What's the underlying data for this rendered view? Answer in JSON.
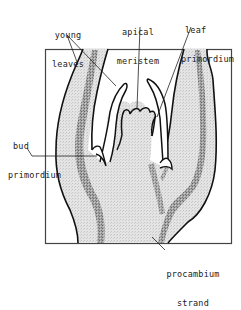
{
  "diagram": {
    "colors": {
      "outline": "#111111",
      "tissue_fill": "#dcdcdc",
      "procambium_fill": "#8a8a8a",
      "background": "#ffffff",
      "frame": "#333333"
    },
    "labels": {
      "young_leaves": {
        "line1": "young",
        "line2": "leaves"
      },
      "apical_meristem": {
        "line1": "apical",
        "line2": "meristem"
      },
      "leaf_primordium": {
        "line1": "leaf",
        "line2": "primordium"
      },
      "bud_primordium": {
        "line1": "bud",
        "line2": "primordium"
      },
      "procambium_strand": {
        "line1": "procambium",
        "line2": "strand"
      }
    }
  }
}
